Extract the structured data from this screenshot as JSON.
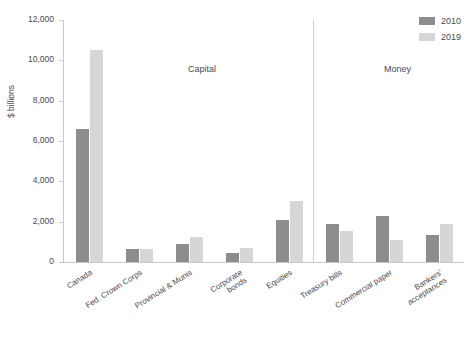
{
  "chart_data": {
    "type": "bar",
    "title": "",
    "xlabel": "",
    "ylabel": "$ billions",
    "ylim": [
      0,
      12000
    ],
    "ytick_labels": [
      "12,000",
      "10,000",
      "8,000",
      "6,000",
      "4,000",
      "2,000",
      "0"
    ],
    "ytick_values": [
      12000,
      10000,
      8000,
      6000,
      4000,
      2000,
      0
    ],
    "grid": false,
    "legend_position": "top-right",
    "categories": [
      "Canada",
      "Fed. Crown Corps",
      "Provincial & Munis",
      "Corporate\nbonds",
      "Equities",
      "Treasury bills",
      "Commercial paper",
      "Bankers'\nacceptances"
    ],
    "series": [
      {
        "name": "2010",
        "color": "#8d8d8d",
        "values": [
          6600,
          650,
          870,
          430,
          2080,
          1900,
          2300,
          1350
        ]
      },
      {
        "name": "2019",
        "color": "#d6d6d6",
        "values": [
          10500,
          640,
          1230,
          680,
          3050,
          1550,
          1100,
          1900
        ]
      }
    ],
    "section_labels": [
      {
        "text": "Capital",
        "x_fraction": 0.31
      },
      {
        "text": "Money",
        "x_fraction": 0.8
      }
    ]
  }
}
